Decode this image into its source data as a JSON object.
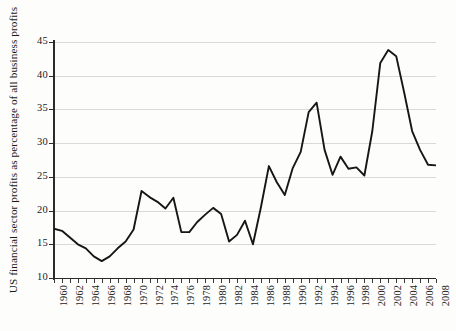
{
  "chart_data": {
    "type": "line",
    "title": "",
    "xlabel": "",
    "ylabel": "US financial sector profits as percentage of all business profits",
    "xlim": [
      1960,
      2008
    ],
    "ylim": [
      10,
      45
    ],
    "ytick_labels": [
      "45",
      "40",
      "35",
      "30",
      "25",
      "20",
      "15",
      "10"
    ],
    "ytick_values": [
      45,
      40,
      35,
      30,
      25,
      20,
      15,
      10
    ],
    "xtick_labels": [
      "1960",
      "1962",
      "1964",
      "1966",
      "1968",
      "1970",
      "1972",
      "1974",
      "1976",
      "1978",
      "1980",
      "1982",
      "1984",
      "1986",
      "1988",
      "1990",
      "1992",
      "1994",
      "1996",
      "1998",
      "2000",
      "2002",
      "2004",
      "2006",
      "2008"
    ],
    "xtick_values": [
      1960,
      1962,
      1964,
      1966,
      1968,
      1970,
      1972,
      1974,
      1976,
      1978,
      1980,
      1982,
      1984,
      1986,
      1988,
      1990,
      1992,
      1994,
      1996,
      1998,
      2000,
      2002,
      2004,
      2006,
      2008
    ],
    "grid": true,
    "grid_axis": "y",
    "legend": false,
    "legend_position": "none",
    "line_color": "#161616",
    "grid_color": "#d9d9d9",
    "axis_color": "#2b2b2b",
    "background_color": "#fdfdfb",
    "x": [
      1960,
      1961,
      1962,
      1963,
      1964,
      1965,
      1966,
      1967,
      1968,
      1969,
      1970,
      1971,
      1972,
      1973,
      1974,
      1975,
      1976,
      1977,
      1978,
      1979,
      1980,
      1981,
      1982,
      1983,
      1984,
      1985,
      1986,
      1987,
      1988,
      1989,
      1990,
      1991,
      1992,
      1993,
      1994,
      1995,
      1996,
      1997,
      1998,
      1999,
      2000,
      2001,
      2002,
      2003,
      2004,
      2005,
      2006,
      2007,
      2008
    ],
    "values": [
      17.3,
      17.0,
      16.0,
      15.0,
      14.4,
      13.2,
      12.5,
      13.2,
      14.4,
      15.4,
      17.2,
      22.9,
      22.0,
      21.3,
      20.3,
      21.9,
      16.8,
      16.8,
      18.3,
      19.4,
      20.4,
      19.5,
      15.4,
      16.4,
      18.5,
      15.0,
      20.5,
      26.6,
      24.2,
      22.3,
      26.3,
      28.7,
      34.6,
      36.0,
      29.0,
      25.3,
      28.0,
      26.2,
      26.4,
      25.2,
      31.8,
      41.9,
      43.8,
      42.9,
      37.5,
      31.8,
      29.0,
      26.8,
      26.7
    ],
    "series": [
      {
        "name": "US financial sector profits",
        "values": [
          17.3,
          17.0,
          16.0,
          15.0,
          14.4,
          13.2,
          12.5,
          13.2,
          14.4,
          15.4,
          17.2,
          22.9,
          22.0,
          21.3,
          20.3,
          21.9,
          16.8,
          16.8,
          18.3,
          19.4,
          20.4,
          19.5,
          15.4,
          16.4,
          18.5,
          15.0,
          20.5,
          26.6,
          24.2,
          22.3,
          26.3,
          28.7,
          34.6,
          36.0,
          29.0,
          25.3,
          28.0,
          26.2,
          26.4,
          25.2,
          31.8,
          41.9,
          43.8,
          42.9,
          37.5,
          31.8,
          29.0,
          26.8,
          26.7
        ]
      }
    ]
  }
}
